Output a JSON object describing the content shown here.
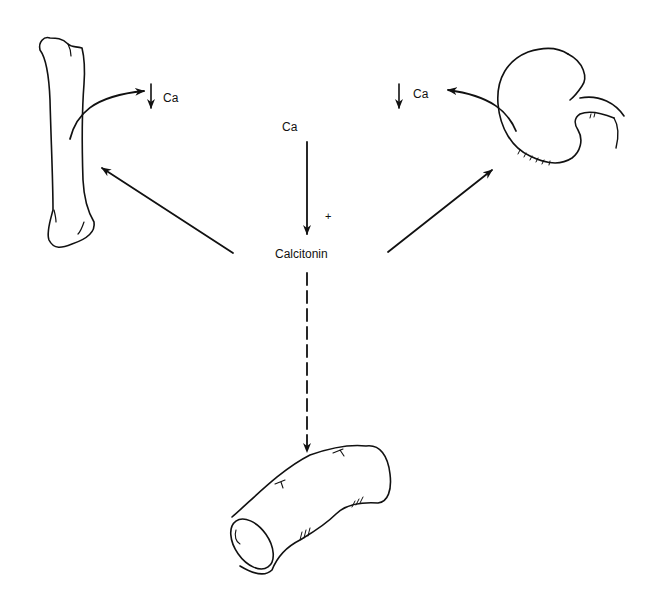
{
  "diagram": {
    "type": "flow",
    "center": {
      "label": "Calcitonin",
      "stimulus": "Ca",
      "stimulus_sign": "+"
    },
    "targets": [
      {
        "name": "bone",
        "icon": "bone-icon",
        "effect_label": "Ca",
        "effect_direction": "down",
        "arrow": "solid"
      },
      {
        "name": "kidney",
        "icon": "kidney-icon",
        "effect_label": "Ca",
        "effect_direction": "down",
        "arrow": "solid"
      },
      {
        "name": "intestine",
        "icon": "intestine-icon",
        "arrow": "dashed"
      }
    ]
  },
  "labels": {
    "stimulus": "Ca",
    "sign": "+",
    "hormone": "Calcitonin",
    "bone_ca": "Ca",
    "kidney_ca": "Ca"
  },
  "colors": {
    "ink": "#111111",
    "background": "#ffffff"
  }
}
